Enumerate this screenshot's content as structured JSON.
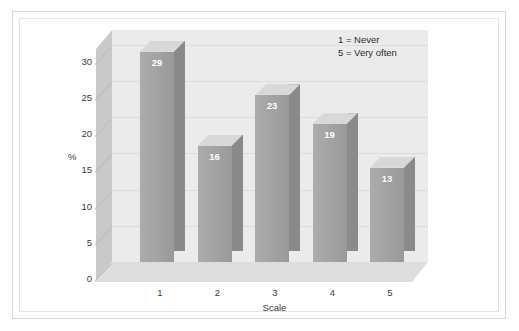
{
  "chart_data": {
    "type": "bar",
    "title": "",
    "subtitle": "",
    "xlabel": "Scale",
    "ylabel": "%",
    "categories": [
      "1",
      "2",
      "3",
      "4",
      "5"
    ],
    "values": [
      29,
      16,
      23,
      19,
      13
    ],
    "data_labels": [
      "29",
      "16",
      "23",
      "19",
      "13"
    ],
    "ylim": [
      0,
      32
    ],
    "yticks": [
      0,
      5,
      10,
      15,
      20,
      25,
      30
    ],
    "ytick_labels": [
      "0",
      "5",
      "10",
      "15",
      "20",
      "25",
      "30"
    ],
    "xtick_labels": [
      "1",
      "2",
      "3",
      "4",
      "5"
    ],
    "grid": true,
    "grid_axis": "y",
    "legend_position": "top-right",
    "annotations": [
      "1 = Never",
      "5 = Very often"
    ],
    "style": "3d-column",
    "colors": {
      "bar_front": "#a2a2a2",
      "bar_top": "#d8d8d8",
      "bar_side": "#8a8a8a",
      "back_wall": "#ebebeb",
      "left_wall": "#c9c9c9",
      "floor": "#dedede",
      "gridline": "#dcdcdc",
      "data_label": "#ffffff",
      "axis_text": "#3b3b3b",
      "frame": "#d6d6d6",
      "background": "#ffffff"
    }
  },
  "legend": {
    "line1": "1 = Never",
    "line2": "5 = Very often"
  },
  "axes": {
    "y_title": "%",
    "x_title": "Scale"
  }
}
